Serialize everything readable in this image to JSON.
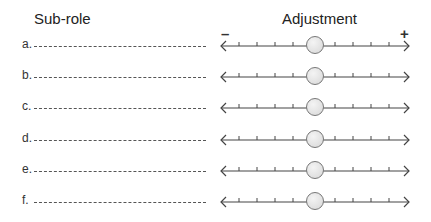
{
  "headers": {
    "sub_role": "Sub-role",
    "adjustment": "Adjustment"
  },
  "scale": {
    "minus_label": "–",
    "plus_label": "+",
    "ticks_per_side": 4
  },
  "rows": [
    {
      "label": "a.",
      "value": 0
    },
    {
      "label": "b.",
      "value": 0
    },
    {
      "label": "c.",
      "value": 0
    },
    {
      "label": "d.",
      "value": 0
    },
    {
      "label": "e.",
      "value": 0
    },
    {
      "label": "f.",
      "value": 0
    }
  ],
  "colors": {
    "knob_fill": "#dcdcdc",
    "knob_stroke": "#777777",
    "line": "#444444"
  }
}
